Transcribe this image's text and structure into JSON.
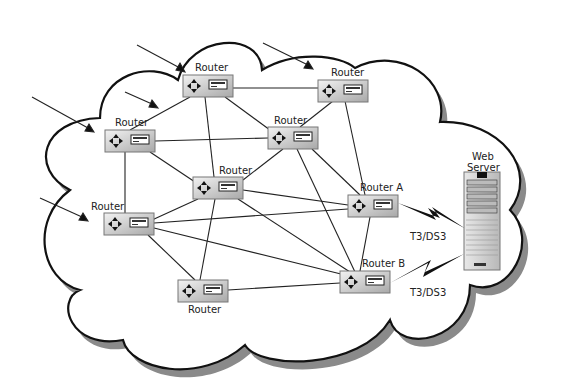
{
  "diagram": {
    "type": "network",
    "cloud": {
      "fill": "#ffffff",
      "stroke": "#111111",
      "shadow": "#888888"
    },
    "routers": [
      {
        "id": "r1",
        "label": "Router",
        "x": 183,
        "y": 75,
        "lx": 195,
        "ly": 71
      },
      {
        "id": "r2",
        "label": "Router",
        "x": 318,
        "y": 80,
        "lx": 331,
        "ly": 76
      },
      {
        "id": "r3",
        "label": "Router",
        "x": 105,
        "y": 130,
        "lx": 115,
        "ly": 126
      },
      {
        "id": "r4",
        "label": "Router",
        "x": 268,
        "y": 127,
        "lx": 274,
        "ly": 124
      },
      {
        "id": "r5",
        "label": "Router",
        "x": 193,
        "y": 177,
        "lx": 219,
        "ly": 174
      },
      {
        "id": "r6",
        "label": "Router",
        "x": 104,
        "y": 213,
        "lx": 91,
        "ly": 210
      },
      {
        "id": "r7",
        "label": "Router A",
        "x": 348,
        "y": 195,
        "lx": 360,
        "ly": 191
      },
      {
        "id": "r8",
        "label": "Router B",
        "x": 340,
        "y": 271,
        "lx": 362,
        "ly": 267
      },
      {
        "id": "r9",
        "label": "Router",
        "x": 178,
        "y": 280,
        "lx": 188,
        "ly": 313
      }
    ],
    "server": {
      "label_line1": "Web",
      "label_line2": "Server"
    },
    "links_wan": [
      {
        "from": "r7",
        "label": "T3/DS3"
      },
      {
        "from": "r8",
        "label": "T3/DS3"
      }
    ]
  }
}
